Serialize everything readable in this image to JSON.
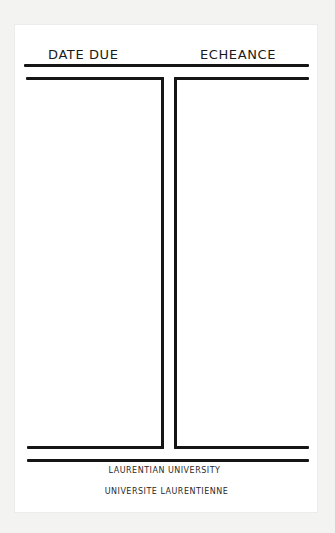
{
  "card": {
    "header": {
      "left_label": "DATE DUE",
      "right_label": "ECHEANCE"
    },
    "columns": [
      {
        "name": "date-due-column",
        "entries": []
      },
      {
        "name": "echeance-column",
        "entries": []
      }
    ],
    "footer": {
      "line1": "LAURENTIAN UNIVERSITY",
      "line2": "UNIVERSITE LAURENTIENNE"
    }
  },
  "colors": {
    "ink": "#151515",
    "card_background": "#ffffff",
    "page_background": "#f3f3f2"
  }
}
